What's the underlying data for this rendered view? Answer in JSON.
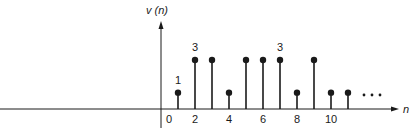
{
  "chart_data": {
    "type": "stem",
    "title": "",
    "ylabel": "v (n)",
    "xlabel": "n",
    "x": [
      0,
      1,
      2,
      3,
      4,
      5,
      6,
      7,
      8,
      9,
      10,
      11
    ],
    "values": [
      0,
      1,
      3,
      3,
      1,
      3,
      3,
      3,
      1,
      3,
      1,
      1
    ],
    "x_tick_labels": [
      "0",
      "2",
      "4",
      "6",
      "8",
      "10"
    ],
    "x_ticks": [
      0,
      2,
      4,
      6,
      8,
      10
    ],
    "annotations": [
      {
        "x": 1,
        "text": "1"
      },
      {
        "x": 2,
        "text": "3"
      },
      {
        "x": 7,
        "text": "3"
      }
    ],
    "continuation": "• • •",
    "ylim": [
      0,
      3
    ],
    "grid": false,
    "legend": null
  },
  "colors": {
    "ink": "#1a1a1a",
    "background": "#ffffff"
  }
}
